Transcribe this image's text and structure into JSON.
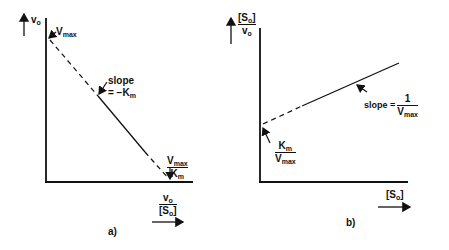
{
  "panel_a": {
    "label": "a)",
    "y_axis": {
      "var": "v",
      "sub": "o"
    },
    "intercept_y": {
      "var": "V",
      "sub": "max"
    },
    "slope": {
      "word": "slope",
      "value": "= −K",
      "sub": "m"
    },
    "intercept_x": {
      "num_var": "V",
      "num_sub": "max",
      "den_var": "K",
      "den_sub": "m"
    },
    "x_axis": {
      "num_var": "v",
      "num_sub": "o",
      "den_pre": "[S",
      "den_sub": "o",
      "den_post": "]"
    }
  },
  "panel_b": {
    "label": "b)",
    "y_axis": {
      "num_pre": "[S",
      "num_sub": "o",
      "num_post": "]",
      "den_var": "v",
      "den_sub": "o"
    },
    "intercept_y": {
      "num_var": "K",
      "num_sub": "m",
      "den_var": "V",
      "den_sub": "max"
    },
    "slope": {
      "word": "slope =",
      "num": "1",
      "den_var": "V",
      "den_sub": "max"
    },
    "x_axis": {
      "pre": "[S",
      "sub": "o",
      "post": "]"
    }
  }
}
